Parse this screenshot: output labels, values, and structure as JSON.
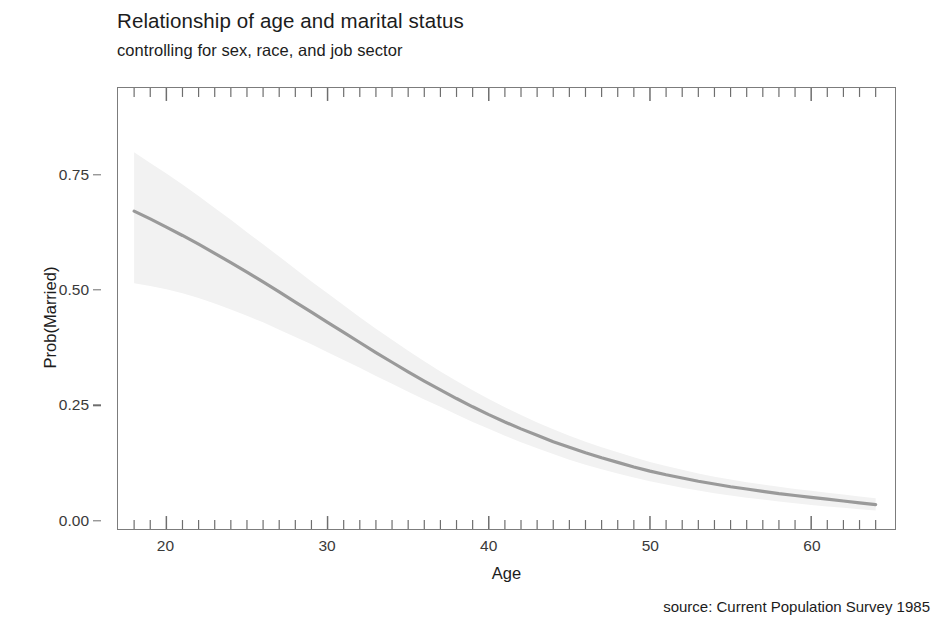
{
  "chart_data": {
    "type": "line",
    "title": "Relationship of age and marital status",
    "subtitle": "controlling for sex, race, and job sector",
    "caption": "source: Current Population Survey 1985",
    "xlabel": "Age",
    "ylabel": "Prob(Married)",
    "xlim": [
      17.0,
      65.2
    ],
    "ylim": [
      -0.02,
      0.94
    ],
    "grid": false,
    "legend": null,
    "xticks_major": [
      20,
      30,
      40,
      50,
      60
    ],
    "xtick_labels": [
      "20",
      "30",
      "40",
      "50",
      "60"
    ],
    "xticks_minor_start": 18,
    "xticks_minor_end": 64,
    "xticks_minor_step": 1,
    "yticks": [
      0.0,
      0.25,
      0.5,
      0.75
    ],
    "ytick_labels": [
      "0.00",
      "0.25",
      "0.50",
      "0.75"
    ],
    "line_color": "#9a9a9a",
    "ribbon_color": "#f2f2f2",
    "panel_border_color": "#7c7c7c",
    "tick_color": "#6e6e6e",
    "series": [
      {
        "name": "Prob(Married)",
        "x": [
          18,
          19,
          20,
          21,
          22,
          23,
          24,
          25,
          26,
          27,
          28,
          29,
          30,
          31,
          32,
          33,
          34,
          35,
          36,
          37,
          38,
          39,
          40,
          41,
          42,
          43,
          44,
          45,
          46,
          47,
          48,
          49,
          50,
          51,
          52,
          53,
          54,
          55,
          56,
          57,
          58,
          59,
          60,
          61,
          62,
          63,
          64
        ],
        "values": [
          0.672,
          0.655,
          0.637,
          0.619,
          0.6,
          0.58,
          0.56,
          0.539,
          0.518,
          0.496,
          0.474,
          0.452,
          0.43,
          0.408,
          0.386,
          0.364,
          0.343,
          0.322,
          0.302,
          0.283,
          0.264,
          0.246,
          0.229,
          0.213,
          0.198,
          0.184,
          0.17,
          0.158,
          0.146,
          0.135,
          0.125,
          0.115,
          0.106,
          0.098,
          0.091,
          0.084,
          0.078,
          0.072,
          0.067,
          0.062,
          0.057,
          0.053,
          0.049,
          0.045,
          0.041,
          0.037,
          0.033
        ],
        "ci_upper": [
          0.8,
          0.777,
          0.754,
          0.73,
          0.705,
          0.679,
          0.653,
          0.626,
          0.6,
          0.573,
          0.546,
          0.519,
          0.493,
          0.467,
          0.441,
          0.416,
          0.392,
          0.368,
          0.345,
          0.323,
          0.302,
          0.282,
          0.263,
          0.245,
          0.228,
          0.212,
          0.197,
          0.183,
          0.17,
          0.158,
          0.147,
          0.136,
          0.126,
          0.117,
          0.109,
          0.101,
          0.094,
          0.088,
          0.082,
          0.077,
          0.072,
          0.067,
          0.063,
          0.059,
          0.055,
          0.051,
          0.047
        ],
        "ci_lower": [
          0.515,
          0.509,
          0.502,
          0.493,
          0.483,
          0.471,
          0.458,
          0.444,
          0.43,
          0.414,
          0.398,
          0.382,
          0.365,
          0.348,
          0.331,
          0.313,
          0.296,
          0.279,
          0.262,
          0.246,
          0.229,
          0.213,
          0.198,
          0.183,
          0.169,
          0.156,
          0.143,
          0.131,
          0.12,
          0.11,
          0.101,
          0.092,
          0.084,
          0.077,
          0.07,
          0.064,
          0.058,
          0.053,
          0.048,
          0.044,
          0.04,
          0.036,
          0.032,
          0.029,
          0.026,
          0.023,
          0.02
        ]
      }
    ]
  }
}
